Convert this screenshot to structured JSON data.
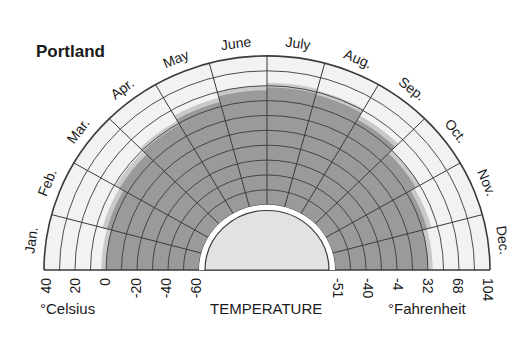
{
  "chart_data": {
    "type": "radial-area",
    "title": "Portland",
    "xlabel": "TEMPERATURE",
    "months": [
      "Jan.",
      "Feb.",
      "Mar.",
      "Apr.",
      "May",
      "June",
      "July",
      "Aug.",
      "Sep.",
      "Oct.",
      "Nov.",
      "Dec."
    ],
    "celsius_ticks": [
      "40",
      "20",
      "0",
      "-20",
      "-40",
      "-60"
    ],
    "fahrenheit_ticks": [
      "-51",
      "-40",
      "-4",
      "32",
      "68",
      "104"
    ],
    "celsius_label": "°Celsius",
    "fahrenheit_label": "°Fahrenheit",
    "radial_range_celsius": [
      -60,
      40
    ],
    "ring_step_celsius": 10,
    "series": [
      {
        "name": "temperature range (max °C)",
        "values": [
          0,
          3,
          6,
          9,
          13,
          17,
          19,
          18,
          13,
          7,
          3,
          0
        ]
      },
      {
        "name": "halo (max °C)",
        "values": [
          3,
          6,
          9,
          12,
          16,
          20,
          22,
          21,
          16,
          10,
          6,
          3
        ]
      }
    ],
    "colors": {
      "dark": "#9a9a9a",
      "halo": "#c9c9c9",
      "light": "#f2f2f2",
      "inner": "#e2e2e2",
      "grid": "#3a3a3a"
    }
  }
}
